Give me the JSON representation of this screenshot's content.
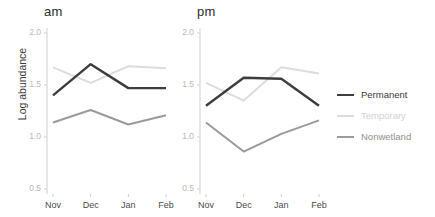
{
  "chart_data": {
    "type": "line",
    "title": "",
    "xlabel": "",
    "ylabel": "Log abundance",
    "categories": [
      "Nov",
      "Dec",
      "Jan",
      "Feb"
    ],
    "ylim": [
      0.38,
      2.12
    ],
    "yticks": [
      0.5,
      1.0,
      1.5,
      2.0
    ],
    "ytick_labels": [
      "0.5",
      "1.0",
      "1.5",
      "2.0"
    ],
    "grid": false,
    "legend_position": "right",
    "panels": [
      {
        "label": "am",
        "series": [
          {
            "name": "Permanent",
            "values": [
              1.4,
              1.7,
              1.47,
              1.47
            ]
          },
          {
            "name": "Temporary",
            "values": [
              1.67,
              1.52,
              1.68,
              1.66
            ]
          },
          {
            "name": "Nonwetland",
            "values": [
              1.14,
              1.26,
              1.12,
              1.21
            ]
          }
        ]
      },
      {
        "label": "pm",
        "series": [
          {
            "name": "Permanent",
            "values": [
              1.3,
              1.57,
              1.56,
              1.3
            ]
          },
          {
            "name": "Temporary",
            "values": [
              1.52,
              1.35,
              1.67,
              1.61
            ]
          },
          {
            "name": "Nonwetland",
            "values": [
              1.14,
              0.86,
              1.03,
              1.16
            ]
          }
        ]
      }
    ],
    "legend": [
      {
        "name": "Permanent",
        "color": "#3d3d3d"
      },
      {
        "name": "Temporary",
        "color": "#dcdcdc"
      },
      {
        "name": "Nonwetland",
        "color": "#9a9a9a"
      }
    ]
  },
  "colors": {
    "permanent": "#3d3d3d",
    "temporary": "#dcdcdc",
    "nonwetland": "#9a9a9a",
    "axis": "#cfcfcf",
    "ytick_text": "#b8b8b8",
    "xtick_text": "#4a4a4a",
    "title_text": "#2b2b2b"
  }
}
